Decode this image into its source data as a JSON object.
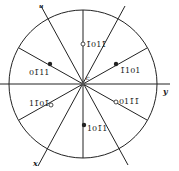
{
  "diagram": {
    "type": "stereographic-projection",
    "axes": {
      "u": "u",
      "y": "y",
      "x": "x",
      "center": "c"
    },
    "poles": [
      {
        "label": "1̄011̄",
        "marker": "open",
        "x": 83,
        "y": 44
      },
      {
        "label": "01̄11",
        "marker": "filled",
        "x": 50,
        "y": 64
      },
      {
        "label": "1̄101",
        "marker": "filled",
        "x": 116,
        "y": 64
      },
      {
        "label": "11̄01̄",
        "marker": "open",
        "x": 50,
        "y": 105
      },
      {
        "label": "011̄1̄",
        "marker": "open",
        "x": 116,
        "y": 102
      },
      {
        "label": "101̄1",
        "marker": "filled",
        "x": 84,
        "y": 125
      }
    ],
    "colors": {
      "line": "#222222",
      "background": "#ffffff"
    }
  }
}
